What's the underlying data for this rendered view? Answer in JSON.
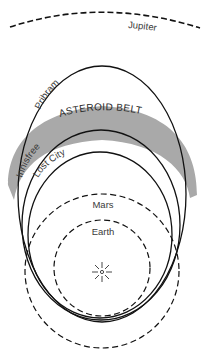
{
  "diagram": {
    "type": "orbital-diagram",
    "colors": {
      "line": "#111111",
      "belt_fill": "#a9a9a9",
      "label": "#3a3a3a",
      "background": "#ffffff"
    },
    "center": {
      "name": "Sun",
      "icon": "sun-icon"
    },
    "planets": [
      {
        "id": "jupiter",
        "label": "Jupiter",
        "style": "dashed",
        "shape": "arc"
      },
      {
        "id": "mars",
        "label": "Mars",
        "style": "dashed",
        "shape": "circle"
      },
      {
        "id": "earth",
        "label": "Earth",
        "style": "dashed",
        "shape": "circle"
      }
    ],
    "meteorite_orbits": [
      {
        "id": "pribram",
        "label": "Pribram",
        "style": "solid",
        "shape": "ellipse"
      },
      {
        "id": "innisfree",
        "label": "Innisfree",
        "style": "solid",
        "shape": "ellipse"
      },
      {
        "id": "lost_city",
        "label": "Lost City",
        "style": "solid",
        "shape": "ellipse"
      }
    ],
    "regions": [
      {
        "id": "asteroid_belt",
        "label": "ASTEROID BELT",
        "fill": "gray band"
      }
    ]
  }
}
